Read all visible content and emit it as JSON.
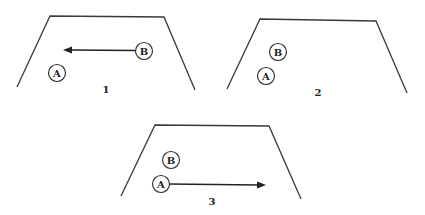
{
  "figure": {
    "panels": [
      {
        "label": "1",
        "balls": [
          {
            "name": "A",
            "label": "A"
          },
          {
            "name": "B",
            "label": "B"
          }
        ],
        "arrow": {
          "from": "B",
          "direction": "left"
        }
      },
      {
        "label": "2",
        "balls": [
          {
            "name": "A",
            "label": "A"
          },
          {
            "name": "B",
            "label": "B"
          }
        ],
        "arrow": null
      },
      {
        "label": "3",
        "balls": [
          {
            "name": "A",
            "label": "A"
          },
          {
            "name": "B",
            "label": "B"
          }
        ],
        "arrow": {
          "from": "A",
          "direction": "right"
        }
      }
    ]
  }
}
